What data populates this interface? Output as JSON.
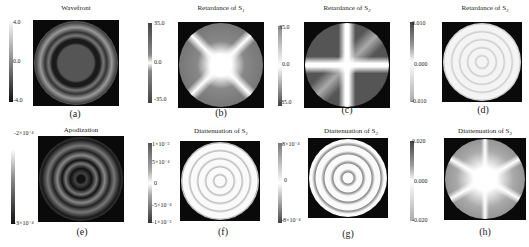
{
  "figure": {
    "panels": [
      {
        "id": "a",
        "title": "Wavefront",
        "subscript": "",
        "caption": "(a)",
        "colorbar": {
          "max": "4.0",
          "mid": "0.0",
          "min": "-4.0"
        },
        "pattern": "concentric-rings"
      },
      {
        "id": "b",
        "title": "Retardance  of S",
        "subscript": "1",
        "caption": "(b)",
        "colorbar": {
          "max": "35.0",
          "mid": "0.0",
          "min": "-35.0"
        },
        "pattern": "diagonal-cross"
      },
      {
        "id": "c",
        "title": "Retardance  of S",
        "subscript": "2",
        "caption": "(c)",
        "colorbar": {
          "max": "35.0",
          "mid": "0.0",
          "min": "-35.0"
        },
        "pattern": "axial-cross"
      },
      {
        "id": "d",
        "title": "Retardance  of S",
        "subscript": "3",
        "caption": "(d)",
        "colorbar": {
          "max": "0.010",
          "mid": "0.000",
          "min": "-0.010"
        },
        "pattern": "hexapole-rings"
      },
      {
        "id": "e",
        "title": "Apodization",
        "subscript": "",
        "caption": "(e)",
        "colorbar": {
          "max": "-2×10⁻⁴",
          "mid": "",
          "min": "-3×10⁻⁴"
        },
        "pattern": "concentric-rings"
      },
      {
        "id": "f",
        "title": "Diattenuation of S",
        "subscript": "1",
        "caption": "(f)",
        "colorbar": {
          "max": "1×10⁻³",
          "upper": "5×10⁻⁴",
          "mid": "0",
          "lower": "-5×10⁻⁴",
          "min": "-1×10⁻³"
        },
        "pattern": "quadrupole-rings"
      },
      {
        "id": "g",
        "title": "Diattenuation of S",
        "subscript": "2",
        "caption": "(g)",
        "colorbar": {
          "max": "8×10⁻⁴",
          "mid": "0",
          "min": "-8×10⁻⁴"
        },
        "pattern": "diagonal-rings"
      },
      {
        "id": "h",
        "title": "Diattenuation of S",
        "subscript": "3",
        "caption": "(h)",
        "colorbar": {
          "max": "0.020",
          "mid": "0.000",
          "min": "-0.020"
        },
        "pattern": "hexapole-star"
      }
    ]
  }
}
